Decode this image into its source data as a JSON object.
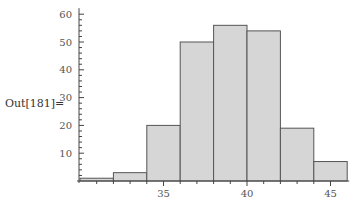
{
  "cell": {
    "out_label": "Out[181]="
  },
  "chart_data": {
    "type": "bar",
    "subtype": "histogram",
    "title": "",
    "xlabel": "",
    "ylabel": "",
    "bin_edges": [
      30,
      32,
      34,
      36,
      38,
      40,
      42,
      44,
      46
    ],
    "categories": [
      "30-32",
      "32-34",
      "34-36",
      "36-38",
      "38-40",
      "40-42",
      "42-44",
      "44-46"
    ],
    "values": [
      1,
      3,
      20,
      50,
      56,
      54,
      19,
      7
    ],
    "xlim": [
      30,
      46
    ],
    "ylim": [
      0,
      60
    ],
    "x_ticks": [
      35,
      40,
      45
    ],
    "y_ticks": [
      10,
      20,
      30,
      40,
      50,
      60
    ],
    "grid": false,
    "legend": null,
    "bar_color": "#d6d6d6",
    "edge_color": "#555555"
  }
}
